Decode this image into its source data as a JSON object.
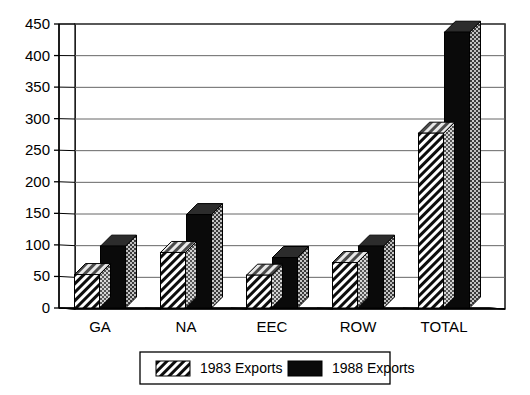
{
  "chart_data": {
    "type": "bar",
    "title": "",
    "subtitle": "",
    "xlabel": "",
    "ylabel": "",
    "categories": [
      "GA",
      "NA",
      "EEC",
      "ROW",
      "TOTAL"
    ],
    "series": [
      {
        "name": "1983 Exports",
        "values": [
          53,
          88,
          52,
          72,
          277
        ],
        "fill": "hatch-diagonal",
        "color": "#111111"
      },
      {
        "name": "1988 Exports",
        "values": [
          98,
          148,
          80,
          98,
          437
        ],
        "fill": "solid",
        "color": "#0a0a0a"
      }
    ],
    "ylim": [
      0,
      450
    ],
    "yticks": [
      0,
      50,
      100,
      150,
      200,
      250,
      300,
      350,
      400,
      450
    ],
    "ytick_labels": [
      "0",
      "50",
      "100",
      "150",
      "200",
      "250",
      "300",
      "350",
      "400",
      "450"
    ],
    "grid": true,
    "grid_axis": "y",
    "legend_position": "bottom",
    "style": "3d-column",
    "background": "#ffffff",
    "axis_color": "#000000",
    "grid_color": "#666666"
  },
  "legend": {
    "items": [
      {
        "label": "1983 Exports",
        "swatch": "hatch-diagonal"
      },
      {
        "label": "1988 Exports",
        "swatch": "solid-black"
      }
    ]
  },
  "axes": {
    "y": {
      "labels": [
        "450",
        "400",
        "350",
        "300",
        "250",
        "200",
        "150",
        "100",
        "50",
        "0"
      ]
    },
    "x": {
      "labels": [
        "GA",
        "NA",
        "EEC",
        "ROW",
        "TOTAL"
      ]
    }
  }
}
